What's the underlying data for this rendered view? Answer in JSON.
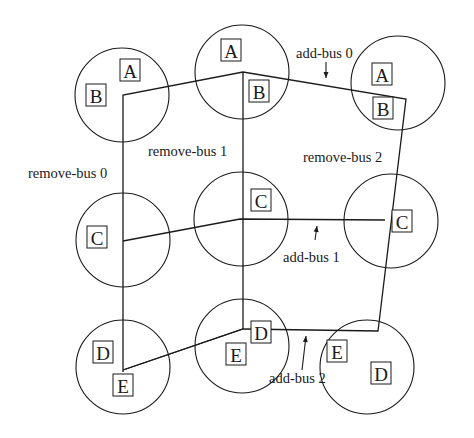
{
  "diagram": {
    "type": "bus-reconfiguration-diagram",
    "colors": {
      "ink": "#1a1a1a",
      "background": "#ffffff"
    },
    "nodes": [
      {
        "id": "n1",
        "cx": 122,
        "cy": 95,
        "r": 47,
        "boxes": [
          {
            "label": "A",
            "x": 130,
            "y": 70
          },
          {
            "label": "B",
            "x": 96,
            "y": 95
          }
        ]
      },
      {
        "id": "n2",
        "cx": 242,
        "cy": 72,
        "r": 47,
        "boxes": [
          {
            "label": "A",
            "x": 231,
            "y": 50
          },
          {
            "label": "B",
            "x": 259,
            "y": 91
          }
        ]
      },
      {
        "id": "n3",
        "cx": 398,
        "cy": 83,
        "r": 47,
        "boxes": [
          {
            "label": "A",
            "x": 382,
            "y": 74
          },
          {
            "label": "B",
            "x": 383,
            "y": 108
          }
        ]
      },
      {
        "id": "n4",
        "cx": 123,
        "cy": 240,
        "r": 47,
        "boxes": [
          {
            "label": "C",
            "x": 97,
            "y": 237
          }
        ]
      },
      {
        "id": "n5",
        "cx": 241,
        "cy": 219,
        "r": 47,
        "boxes": [
          {
            "label": "C",
            "x": 261,
            "y": 200
          }
        ]
      },
      {
        "id": "n6",
        "cx": 391,
        "cy": 221,
        "r": 47,
        "boxes": [
          {
            "label": "C",
            "x": 402,
            "y": 221
          }
        ]
      },
      {
        "id": "n7",
        "cx": 123,
        "cy": 367,
        "r": 47,
        "boxes": [
          {
            "label": "D",
            "x": 103,
            "y": 352
          },
          {
            "label": "E",
            "x": 123,
            "y": 385
          }
        ]
      },
      {
        "id": "n8",
        "cx": 242,
        "cy": 346,
        "r": 47,
        "boxes": [
          {
            "label": "D",
            "x": 261,
            "y": 332
          },
          {
            "label": "E",
            "x": 236,
            "y": 354
          }
        ]
      },
      {
        "id": "n9",
        "cx": 367,
        "cy": 367,
        "r": 47,
        "boxes": [
          {
            "label": "E",
            "x": 337,
            "y": 351
          },
          {
            "label": "D",
            "x": 381,
            "y": 373
          }
        ]
      }
    ],
    "buses": [
      {
        "name": "bus-top",
        "points": "123,372 123,95 243,72 406,99 378,331 243,329 123,370"
      },
      {
        "name": "remove-bus-1-line",
        "points": "243,72 243,329"
      },
      {
        "name": "add-bus-1-line",
        "points": "123,241 240,219 385,220"
      },
      {
        "name": "add-bus-2-line",
        "points": "123,370 243,329"
      }
    ],
    "labels": [
      {
        "name": "add-bus-0",
        "text": "add-bus 0",
        "x": 296,
        "y": 58
      },
      {
        "name": "remove-bus-1",
        "text": "remove-bus 1",
        "x": 148,
        "y": 156
      },
      {
        "name": "remove-bus-2",
        "text": "remove-bus 2",
        "x": 303,
        "y": 162
      },
      {
        "name": "remove-bus-0",
        "text": "remove-bus 0",
        "x": 28,
        "y": 178
      },
      {
        "name": "add-bus-1",
        "text": "add-bus 1",
        "x": 283,
        "y": 262
      },
      {
        "name": "add-bus-2",
        "text": "add-bus 2",
        "x": 269,
        "y": 383
      }
    ],
    "arrows": [
      {
        "name": "add-bus-0-arrow",
        "x1": 326,
        "y1": 62,
        "x2": 326,
        "y2": 78,
        "dir": "down"
      },
      {
        "name": "add-bus-1-arrow",
        "x1": 315,
        "y1": 240,
        "x2": 317,
        "y2": 226,
        "dir": "up"
      },
      {
        "name": "add-bus-2-arrow",
        "x1": 302,
        "y1": 370,
        "x2": 306,
        "y2": 336,
        "dir": "up"
      }
    ]
  }
}
